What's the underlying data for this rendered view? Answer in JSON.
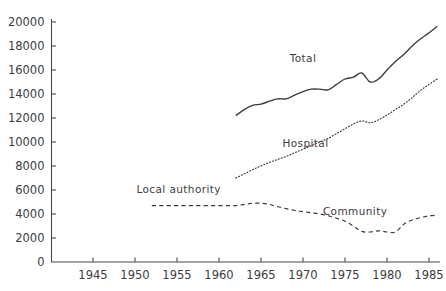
{
  "chart_data": {
    "type": "line",
    "title": "",
    "subtitle": "",
    "xlabel": "",
    "ylabel": "",
    "xlim": [
      1941,
      1986.5
    ],
    "ylim": [
      0,
      20000
    ],
    "grid": false,
    "legend_position": "inline-annotations",
    "x_ticks": [
      1945,
      1950,
      1955,
      1960,
      1965,
      1970,
      1975,
      1980,
      1985
    ],
    "y_ticks": [
      0,
      2000,
      4000,
      6000,
      8000,
      10000,
      12000,
      14000,
      16000,
      18000,
      20000
    ],
    "x_tick_labels": [
      "1945",
      "1950",
      "1955",
      "1960",
      "1965",
      "1970",
      "1975",
      "1980",
      "1985"
    ],
    "y_tick_labels": [
      "0",
      "2000",
      "4000",
      "6000",
      "8000",
      "10000",
      "12000",
      "14000",
      "16000",
      "18000",
      "20000"
    ],
    "series": [
      {
        "name": "Total",
        "style": "solid",
        "label": "Total",
        "label_x": 1970.0,
        "label_y": 16700,
        "x": [
          1962,
          1963,
          1964,
          1965,
          1966,
          1967,
          1968,
          1969,
          1970,
          1971,
          1972,
          1973,
          1974,
          1975,
          1976,
          1977,
          1978,
          1979,
          1980,
          1981,
          1982,
          1983,
          1984,
          1985,
          1986
        ],
        "values": [
          12200,
          12700,
          13050,
          13150,
          13400,
          13600,
          13600,
          13900,
          14200,
          14400,
          14400,
          14350,
          14800,
          15250,
          15400,
          15750,
          15000,
          15250,
          16000,
          16700,
          17300,
          18000,
          18600,
          19100,
          19650
        ]
      },
      {
        "name": "Hospital",
        "style": "dotted",
        "label": "Hospital",
        "label_x": 1970.3,
        "label_y": 9600,
        "x": [
          1962,
          1963,
          1964,
          1965,
          1966,
          1967,
          1968,
          1969,
          1970,
          1971,
          1972,
          1973,
          1974,
          1975,
          1976,
          1977,
          1978,
          1979,
          1980,
          1981,
          1982,
          1983,
          1984,
          1985,
          1986
        ],
        "values": [
          7000,
          7350,
          7700,
          8000,
          8300,
          8550,
          8800,
          9100,
          9400,
          9700,
          10000,
          10300,
          10700,
          11100,
          11500,
          11750,
          11600,
          11850,
          12250,
          12700,
          13150,
          13700,
          14300,
          14800,
          15250
        ]
      },
      {
        "name": "Community",
        "style": "dashed",
        "label_left": "Local authority",
        "label_left_x": 1955.2,
        "label_left_y": 5750,
        "label_right": "Community",
        "label_right_x": 1976.2,
        "label_right_y": 3950,
        "x": [
          1952,
          1953,
          1954,
          1955,
          1956,
          1957,
          1958,
          1959,
          1960,
          1961,
          1962,
          1963,
          1964,
          1965,
          1966,
          1967,
          1968,
          1969,
          1970,
          1971,
          1972,
          1973,
          1974,
          1975,
          1976,
          1977,
          1978,
          1979,
          1980,
          1981,
          1982,
          1983,
          1984,
          1985,
          1986
        ],
        "values": [
          4700,
          4700,
          4700,
          4700,
          4700,
          4700,
          4700,
          4700,
          4700,
          4700,
          4700,
          4800,
          4900,
          4900,
          4800,
          4600,
          4450,
          4300,
          4200,
          4100,
          4000,
          3850,
          3650,
          3400,
          3000,
          2550,
          2500,
          2600,
          2500,
          2500,
          3150,
          3500,
          3700,
          3850,
          3900
        ]
      }
    ]
  }
}
